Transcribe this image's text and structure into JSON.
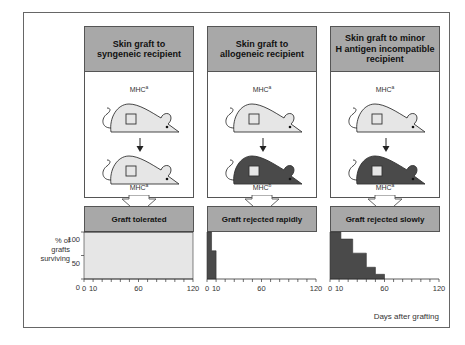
{
  "figure": {
    "panels": [
      {
        "title": "Skin graft to syngeneic recipient",
        "title_lines": [
          "Skin graft to",
          "syngeneic recipient"
        ],
        "donor": {
          "label": "MHC",
          "sup": "a",
          "color": "#e6e6e6"
        },
        "recipient": {
          "label": "MHC",
          "sup": "a",
          "color": "#e6e6e6"
        },
        "result": "Graft tolerated"
      },
      {
        "title": "Skin graft to allogeneic recipient",
        "title_lines": [
          "Skin graft to",
          "allogeneic recipient"
        ],
        "donor": {
          "label": "MHC",
          "sup": "a",
          "color": "#e6e6e6"
        },
        "recipient": {
          "label": "MHC",
          "sup": "b",
          "color": "#4a4a4a"
        },
        "result": "Graft rejected rapidly"
      },
      {
        "title": "Skin graft to minor H antigen incompatible recipient",
        "title_lines": [
          "Skin graft to minor",
          "H antigen incompatible",
          "recipient"
        ],
        "donor": {
          "label": "MHC",
          "sup": "a",
          "color": "#e6e6e6"
        },
        "recipient": {
          "label": "MHC",
          "sup": "a",
          "color": "#4a4a4a"
        },
        "result": "Graft rejected slowly"
      }
    ],
    "y_axis_label_lines": [
      "% of",
      "grafts",
      "surviving"
    ],
    "y_ticks": [
      "100",
      "50",
      "0"
    ],
    "x_ticks": [
      "0",
      "10",
      "60",
      "120"
    ],
    "x_axis_label": "Days after grafting",
    "colors": {
      "header_fill": "#a8a8a8",
      "light_fill": "#e6e6e6",
      "dark_fill": "#4a4a4a",
      "border": "#555555"
    }
  },
  "chart_data": [
    {
      "type": "area",
      "title": "Graft tolerated",
      "xlabel": "Days after grafting",
      "ylabel": "% of grafts surviving",
      "x": [
        0,
        120
      ],
      "values": [
        100,
        100
      ],
      "xlim": [
        0,
        120
      ],
      "ylim": [
        0,
        100
      ],
      "xticks": [
        0,
        10,
        60,
        120
      ],
      "yticks": [
        0,
        50,
        100
      ]
    },
    {
      "type": "area",
      "title": "Graft rejected rapidly",
      "xlabel": "Days after grafting",
      "ylabel": "% of grafts surviving",
      "step": true,
      "x": [
        0,
        5,
        10
      ],
      "values": [
        100,
        60,
        0
      ],
      "xlim": [
        0,
        120
      ],
      "ylim": [
        0,
        100
      ],
      "xticks": [
        0,
        10,
        60,
        120
      ]
    },
    {
      "type": "area",
      "title": "Graft rejected slowly",
      "xlabel": "Days after grafting",
      "ylabel": "% of grafts surviving",
      "step": true,
      "x": [
        0,
        12,
        25,
        40,
        50,
        60
      ],
      "values": [
        100,
        85,
        55,
        25,
        10,
        0
      ],
      "xlim": [
        0,
        120
      ],
      "ylim": [
        0,
        100
      ],
      "xticks": [
        0,
        10,
        60,
        120
      ]
    }
  ]
}
